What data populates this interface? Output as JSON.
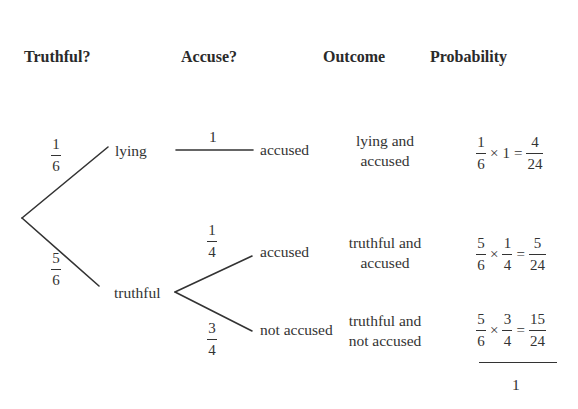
{
  "headers": {
    "truthful": "Truthful?",
    "accuse": "Accuse?",
    "outcome": "Outcome",
    "probability": "Probability"
  },
  "tree": {
    "level1": {
      "lying": {
        "label": "lying",
        "prob_num": "1",
        "prob_den": "6"
      },
      "truthful": {
        "label": "truthful",
        "prob_num": "5",
        "prob_den": "6"
      }
    },
    "level2": {
      "lying_accused": {
        "label": "accused",
        "prob": "1"
      },
      "truthful_accused": {
        "label": "accused",
        "prob_num": "1",
        "prob_den": "4"
      },
      "truthful_not_accused": {
        "label": "not accused",
        "prob_num": "3",
        "prob_den": "4"
      }
    }
  },
  "outcomes": [
    {
      "line1": "lying and",
      "line2": "accused",
      "calc": {
        "a_num": "1",
        "a_den": "6",
        "times": "×",
        "b": "1",
        "equals": "=",
        "r_num": "4",
        "r_den": "24"
      }
    },
    {
      "line1": "truthful and",
      "line2": "accused",
      "calc": {
        "a_num": "5",
        "a_den": "6",
        "times": "×",
        "b_num": "1",
        "b_den": "4",
        "equals": "=",
        "r_num": "5",
        "r_den": "24"
      }
    },
    {
      "line1": "truthful and",
      "line2": "not accused",
      "calc": {
        "a_num": "5",
        "a_den": "6",
        "times": "×",
        "b_num": "3",
        "b_den": "4",
        "equals": "=",
        "r_num": "15",
        "r_den": "24"
      }
    }
  ],
  "total": "1",
  "colors": {
    "ink": "#333333",
    "background": "#ffffff"
  }
}
